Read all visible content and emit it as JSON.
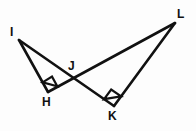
{
  "figure": {
    "background_color": "#fdfdfd",
    "stroke_color": "#111111",
    "stroke_width": 2.6
  },
  "vertices": [
    {
      "id": "I",
      "label": "I",
      "x": 19,
      "y": 40,
      "label_x": 10,
      "label_y": 26
    },
    {
      "id": "H",
      "label": "H",
      "x": 48,
      "y": 92,
      "label_x": 42,
      "label_y": 96
    },
    {
      "id": "J",
      "label": "J",
      "x": 72,
      "y": 77,
      "label_x": 68,
      "label_y": 60
    },
    {
      "id": "K",
      "label": "K",
      "x": 114,
      "y": 106,
      "label_x": 108,
      "label_y": 110
    },
    {
      "id": "L",
      "label": "L",
      "x": 175,
      "y": 23,
      "label_x": 177,
      "label_y": 8
    }
  ],
  "segments": [
    {
      "id": "IH",
      "from": "I",
      "to": "H",
      "x1": 19,
      "y1": 40,
      "x2": 48,
      "y2": 92
    },
    {
      "id": "IJK",
      "from": "I",
      "to": "K",
      "x1": 19,
      "y1": 40,
      "x2": 114,
      "y2": 106
    },
    {
      "id": "HJL",
      "from": "H",
      "to": "L",
      "x1": 48,
      "y1": 92,
      "x2": 175,
      "y2": 23
    },
    {
      "id": "KL",
      "from": "K",
      "to": "L",
      "x1": 114,
      "y1": 106,
      "x2": 175,
      "y2": 23
    }
  ],
  "right_angles": [
    {
      "id": "angle-H",
      "at": "H",
      "measure": "90",
      "marker_points": "41.5,76.5 52.5,84.0 45.5,87.8"
    },
    {
      "id": "angle-K",
      "at": "K",
      "measure": "90",
      "marker_points": "105.5,92.0 117.0,88.5 119.5,98.0"
    }
  ],
  "triangles": [
    {
      "id": "IHJ",
      "label": "IHJ",
      "vertices": [
        "I",
        "H",
        "J"
      ],
      "right_angle_at": "H"
    },
    {
      "id": "JKL",
      "label": "JKL",
      "vertices": [
        "J",
        "K",
        "L"
      ],
      "right_angle_at": "K"
    }
  ]
}
